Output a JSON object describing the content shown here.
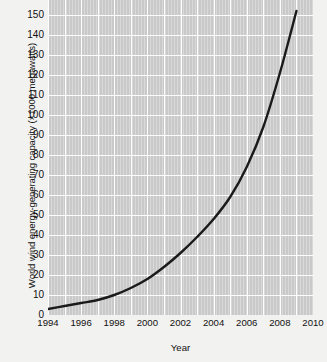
{
  "chart_data": {
    "type": "line",
    "title": "",
    "xlabel": "Year",
    "ylabel": "World wind energy-generating capacity (×1000 megawatts)",
    "xlim": [
      1994,
      2010
    ],
    "ylim": [
      0,
      160
    ],
    "grid": true,
    "legend": "none",
    "xticks": [
      "1994",
      "1996",
      "1998",
      "2000",
      "2002",
      "2004",
      "2006",
      "2008",
      "2010"
    ],
    "xtick_values": [
      1994,
      1996,
      1998,
      2000,
      2002,
      2004,
      2006,
      2008,
      2010
    ],
    "yticks": [
      "0",
      "10",
      "20",
      "30",
      "40",
      "50",
      "60",
      "70",
      "80",
      "90",
      "100",
      "110",
      "120",
      "130",
      "140",
      "150",
      "160"
    ],
    "ytick_values": [
      0,
      10,
      20,
      30,
      40,
      50,
      60,
      70,
      80,
      90,
      100,
      110,
      120,
      130,
      140,
      150,
      160
    ],
    "line_color": "#1a1a1a",
    "plot_background": "#c9c9c9",
    "gridline_color": "#fdfdfd",
    "series": [
      {
        "name": "World wind energy-generating capacity",
        "x": [
          1994,
          1995,
          1996,
          1997,
          1998,
          1999,
          2000,
          2001,
          2002,
          2003,
          2004,
          2005,
          2006,
          2007,
          2008,
          2009
        ],
        "values": [
          3,
          4.5,
          6,
          7.5,
          10,
          13.5,
          18,
          24,
          31,
          39,
          48,
          59,
          74,
          94,
          121,
          152
        ]
      }
    ]
  }
}
